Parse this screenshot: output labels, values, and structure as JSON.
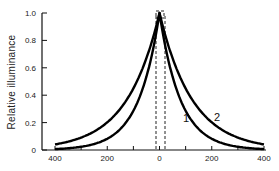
{
  "chart_data": {
    "type": "line",
    "title": "",
    "xlabel": "",
    "ylabel": "Relative illuminance",
    "xlim": [
      -400,
      400
    ],
    "ylim": [
      0,
      1.0
    ],
    "x_ticks": [
      -400,
      -300,
      -200,
      -100,
      0,
      100,
      200,
      300,
      400
    ],
    "x_tick_labels": [
      "400",
      "200",
      "0",
      "200",
      "400"
    ],
    "x_tick_label_values": [
      -400,
      -200,
      0,
      200,
      400
    ],
    "y_ticks": [
      0,
      0.2,
      0.4,
      0.6,
      0.8,
      1.0
    ],
    "y_tick_labels": [
      "0",
      "0.2",
      "0.4",
      "0.6",
      "0.8",
      "1.0"
    ],
    "grid": false,
    "legend": "inline curve labels",
    "annotations": [
      {
        "type": "dashed-vertical-lines",
        "x": [
          -15,
          15
        ],
        "note": "dashed lines bounding central region"
      },
      {
        "type": "dashed-box",
        "x": 0,
        "y": 1.0,
        "note": "small dashed square at peak"
      }
    ],
    "x": [
      -400,
      -350,
      -300,
      -250,
      -200,
      -150,
      -100,
      -50,
      0,
      50,
      100,
      150,
      200,
      250,
      300,
      350,
      400
    ],
    "series": [
      {
        "name": "1",
        "values": [
          0.01,
          0.02,
          0.03,
          0.06,
          0.1,
          0.17,
          0.28,
          0.52,
          1.0,
          0.52,
          0.28,
          0.17,
          0.1,
          0.06,
          0.03,
          0.02,
          0.01
        ]
      },
      {
        "name": "2",
        "values": [
          0.03,
          0.05,
          0.08,
          0.13,
          0.2,
          0.3,
          0.44,
          0.66,
          1.0,
          0.66,
          0.44,
          0.3,
          0.2,
          0.13,
          0.08,
          0.05,
          0.03
        ]
      }
    ]
  },
  "labels": {
    "y_title": "Relative illuminance",
    "curve1": "1",
    "curve2": "2",
    "y_ticks": [
      "0",
      "0.2",
      "0.4",
      "0.6",
      "0.8",
      "1.0"
    ],
    "x_ticks": [
      "400",
      "200",
      "0",
      "200",
      "400"
    ]
  },
  "colors": {
    "curve": "#000000",
    "axis": "#111111",
    "background": "#ffffff"
  }
}
